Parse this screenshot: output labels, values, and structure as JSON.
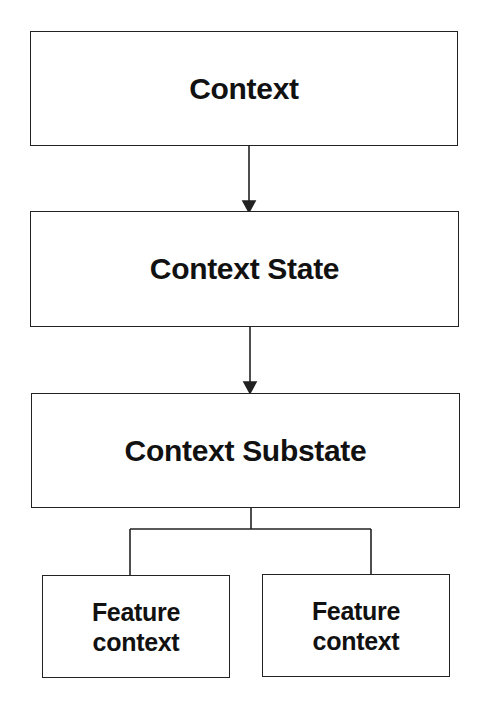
{
  "diagram": {
    "nodes": [
      {
        "id": "context",
        "label": "Context"
      },
      {
        "id": "context-state",
        "label": "Context State"
      },
      {
        "id": "context-substate",
        "label": "Context Substate"
      },
      {
        "id": "feature-context-1",
        "label_line1": "Feature",
        "label_line2": "context"
      },
      {
        "id": "feature-context-2",
        "label_line1": "Feature",
        "label_line2": "context"
      }
    ],
    "edges": [
      {
        "from": "context",
        "to": "context-state",
        "type": "arrow"
      },
      {
        "from": "context-state",
        "to": "context-substate",
        "type": "arrow"
      },
      {
        "from": "context-substate",
        "to": "feature-context-1",
        "type": "line"
      },
      {
        "from": "context-substate",
        "to": "feature-context-2",
        "type": "line"
      }
    ],
    "colors": {
      "stroke": "#222222",
      "text": "#111111",
      "background": "#ffffff"
    }
  }
}
